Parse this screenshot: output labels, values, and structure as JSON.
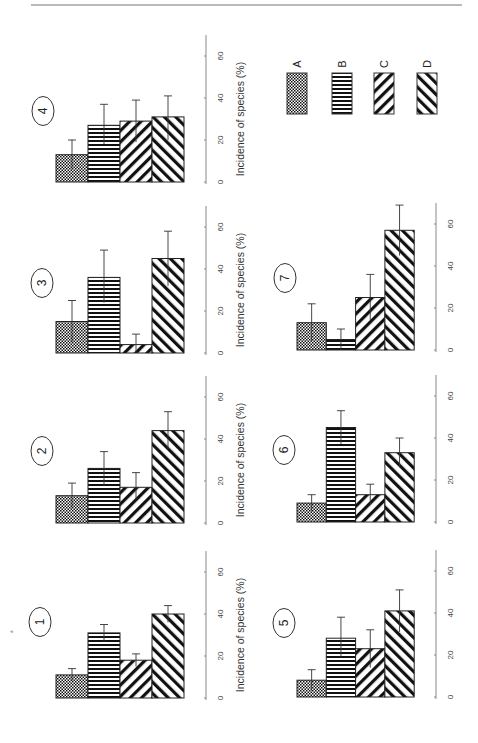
{
  "chart_data": {
    "type": "bar",
    "title": "",
    "categories": [
      "A",
      "B",
      "C",
      "D"
    ],
    "legend": {
      "entries": [
        {
          "label": "A",
          "pattern": "checkerboard"
        },
        {
          "label": "B",
          "pattern": "horizontal-stripes"
        },
        {
          "label": "C",
          "pattern": "diagonal-forward"
        },
        {
          "label": "D",
          "pattern": "diagonal-backward"
        }
      ],
      "placement": "top-right"
    },
    "ylabel": "Incidence of species (%)",
    "xlabel": "",
    "ylim": [
      0,
      70
    ],
    "yticks": [
      "0",
      "20",
      "40",
      "60"
    ],
    "rotation": "figure rotated 90 degrees counter-clockwise on page",
    "panels": [
      {
        "id": "1",
        "values": [
          11,
          31,
          18,
          40
        ],
        "errors_upper": [
          14,
          35,
          21,
          44
        ],
        "errors_lower": [
          8,
          27,
          15,
          36
        ]
      },
      {
        "id": "2",
        "values": [
          13,
          26,
          17,
          44
        ],
        "errors_upper": [
          19,
          34,
          24,
          53
        ],
        "errors_lower": [
          7,
          18,
          11,
          35
        ]
      },
      {
        "id": "3",
        "values": [
          15,
          36,
          4,
          45
        ],
        "errors_upper": [
          25,
          49,
          9,
          58
        ],
        "errors_lower": [
          5,
          24,
          0,
          32
        ]
      },
      {
        "id": "4",
        "values": [
          13,
          27,
          29,
          31
        ],
        "errors_upper": [
          20,
          37,
          39,
          41
        ],
        "errors_lower": [
          6,
          18,
          19,
          20
        ]
      },
      {
        "id": "5",
        "values": [
          8,
          28,
          23,
          41
        ],
        "errors_upper": [
          13,
          38,
          32,
          51
        ],
        "errors_lower": [
          3,
          19,
          14,
          31
        ]
      },
      {
        "id": "6",
        "values": [
          9,
          45,
          13,
          33
        ],
        "errors_upper": [
          13,
          53,
          18,
          40
        ],
        "errors_lower": [
          5,
          37,
          8,
          26
        ]
      },
      {
        "id": "7",
        "values": [
          13,
          5,
          25,
          57
        ],
        "errors_upper": [
          22,
          10,
          36,
          69
        ],
        "errors_lower": [
          4,
          0,
          14,
          45
        ]
      }
    ]
  },
  "page": {
    "marker": "*"
  }
}
